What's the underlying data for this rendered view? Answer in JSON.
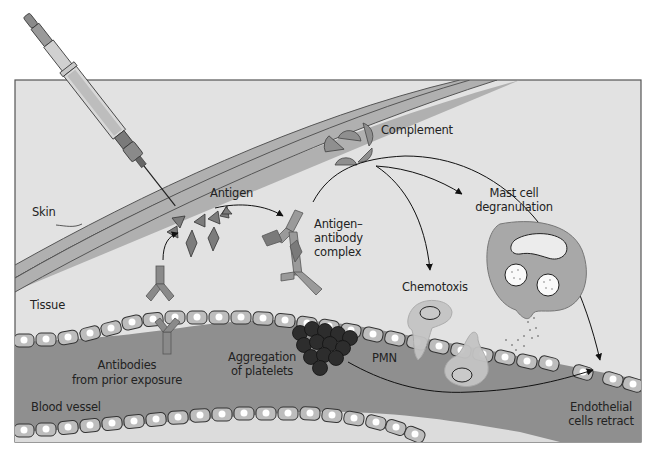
{
  "diagram": {
    "colors": {
      "panel_bg": "#e2e2e2",
      "panel_border": "#555555",
      "skin": "#b0b0b0",
      "blood": "#8f8f8f",
      "cells": "#b9b9b9",
      "molecule": "#8a8a8a",
      "platelets": "#2e2e2e",
      "mast_cell": "#a8a8a8"
    },
    "labels": {
      "skin": "Skin",
      "tissue": "Tissue",
      "antigen": "Antigen",
      "complex_1": "Antigen–",
      "complex_2": "antibody",
      "complex_3": "complex",
      "complement": "Complement",
      "mast_1": "Mast cell",
      "mast_2": "degranulation",
      "chemotoxis": "Chemotoxis",
      "antibodies_1": "Antibodies",
      "antibodies_2": "from prior exposure",
      "aggregation_1": "Aggregation",
      "aggregation_2": "of platelets",
      "pmn": "PMN",
      "blood_vessel": "Blood vessel",
      "endothelial_1": "Endothelial",
      "endothelial_2": "cells retract"
    },
    "nodes": [
      {
        "id": "syringe",
        "label": "Syringe injecting antigen"
      },
      {
        "id": "antigen",
        "label": "Antigen"
      },
      {
        "id": "antibodies",
        "label": "Antibodies from prior exposure"
      },
      {
        "id": "complex",
        "label": "Antigen–antibody complex"
      },
      {
        "id": "complement",
        "label": "Complement"
      },
      {
        "id": "mast",
        "label": "Mast cell degranulation"
      },
      {
        "id": "chemotoxis",
        "label": "Chemotoxis"
      },
      {
        "id": "pmn",
        "label": "PMN"
      },
      {
        "id": "platelets",
        "label": "Aggregation of platelets"
      },
      {
        "id": "endothelial",
        "label": "Endothelial cells retract"
      }
    ],
    "edges": [
      {
        "from": "antibodies",
        "to": "antigen"
      },
      {
        "from": "antigen",
        "to": "complex"
      },
      {
        "from": "complex",
        "to": "mast"
      },
      {
        "from": "complex",
        "to": "chemotoxis"
      },
      {
        "from": "complex",
        "to": "endothelial"
      },
      {
        "from": "platelets",
        "to": "endothelial"
      }
    ]
  }
}
